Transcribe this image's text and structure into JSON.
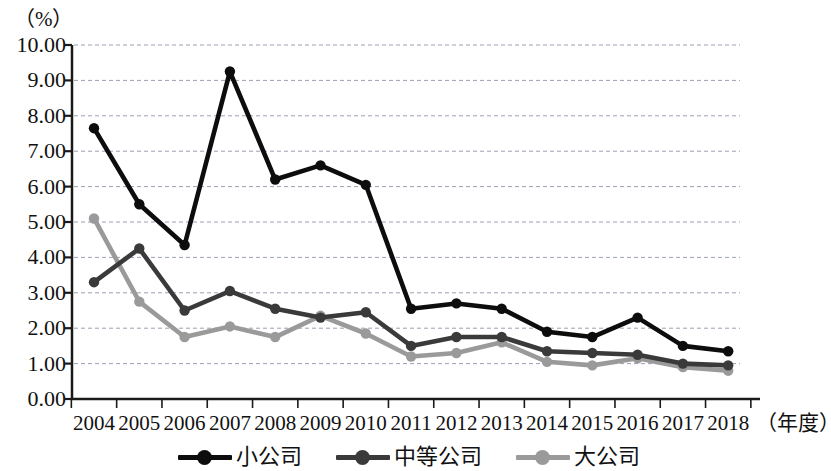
{
  "chart_data": {
    "type": "line",
    "title": "",
    "subtitle": "",
    "unit_label": "（%）",
    "xlabel": "（年度）",
    "ylabel": "",
    "categories": [
      "2004",
      "2005",
      "2006",
      "2007",
      "2008",
      "2009",
      "2010",
      "2011",
      "2012",
      "2013",
      "2014",
      "2015",
      "2016",
      "2017",
      "2018"
    ],
    "ylim": [
      0,
      10
    ],
    "ytick_labels": [
      "0.00",
      "1.00",
      "2.00",
      "3.00",
      "4.00",
      "5.00",
      "6.00",
      "7.00",
      "8.00",
      "9.00",
      "10.00"
    ],
    "ytick_values": [
      0,
      1,
      2,
      3,
      4,
      5,
      6,
      7,
      8,
      9,
      10
    ],
    "grid": true,
    "grid_style": "dashed",
    "legend_position": "bottom",
    "series": [
      {
        "name": "小公司",
        "color": "#0d0d0d",
        "values": [
          7.65,
          5.5,
          4.35,
          9.25,
          6.2,
          6.6,
          6.05,
          2.55,
          2.7,
          2.55,
          1.9,
          1.75,
          2.3,
          1.5,
          1.35
        ]
      },
      {
        "name": "中等公司",
        "color": "#3a3a3a",
        "values": [
          3.3,
          4.25,
          2.5,
          3.05,
          2.55,
          2.3,
          2.45,
          1.5,
          1.75,
          1.75,
          1.35,
          1.3,
          1.25,
          1.0,
          0.95
        ]
      },
      {
        "name": "大公司",
        "color": "#9a9a9a",
        "values": [
          5.1,
          2.75,
          1.75,
          2.05,
          1.75,
          2.35,
          1.85,
          1.2,
          1.3,
          1.6,
          1.05,
          0.95,
          1.15,
          0.9,
          0.8
        ]
      }
    ]
  },
  "legend": {
    "items": [
      {
        "label": "小公司",
        "color": "#0d0d0d"
      },
      {
        "label": "中等公司",
        "color": "#3a3a3a"
      },
      {
        "label": "大公司",
        "color": "#9a9a9a"
      }
    ]
  },
  "colors": {
    "background": "#ffffff",
    "axis": "#1a1a1a",
    "grid": "#9aa0b0",
    "text": "#111111"
  }
}
